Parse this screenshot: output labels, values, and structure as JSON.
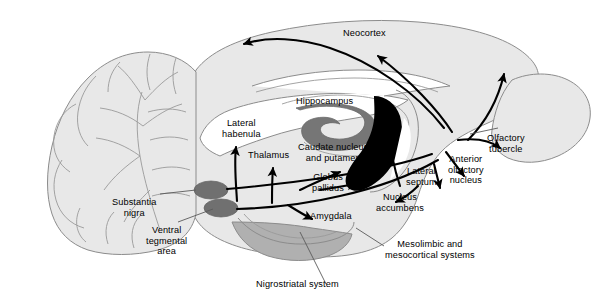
{
  "figure": {
    "type": "anatomical-diagram",
    "background_color": "#ffffff",
    "outline_color": "#808080",
    "brain_fill": "#e8e8e8",
    "nucleus_fill": "#707070",
    "caudate_fill": "#000000",
    "pathway_color": "#000000",
    "leader_color": "#555555"
  },
  "labels": {
    "neocortex": "Neocortex",
    "hippocampus": "Hippocampus",
    "lateral_habenula": "Lateral\nhabenula",
    "thalamus": "Thalamus",
    "caudate_putamen": "Caudate nucleus\nand putamen",
    "globus_pallidus": "Globus\npallidus",
    "amygdala": "Amygdala",
    "lateral_septum": "Lateral\nseptum",
    "nucleus_accumbens": "Nucleus\naccumbens",
    "anterior_olfactory_nucleus": "Anterior\nolfactory\nnucleus",
    "olfactory_tubercle": "Olfactory\ntubercle",
    "substantia_nigra": "Substantia\nnigra",
    "ventral_tegmental_area": "Ventral\ntegmental\narea",
    "nigrostriatal_system": "Nigrostriatal system",
    "mesolimbic_mesocortical": "Mesolimbic and\nmesocortical systems"
  },
  "structures": [
    {
      "name": "cerebellum",
      "fill": "#e8e8e8"
    },
    {
      "name": "cerebral-cortex",
      "fill": "#e8e8e8"
    },
    {
      "name": "olfactory-bulb",
      "fill": "#e8e8e8"
    },
    {
      "name": "hippocampus-body",
      "fill": "#767676"
    },
    {
      "name": "caudate-putamen-body",
      "fill": "#000000"
    },
    {
      "name": "substantia-nigra-body",
      "fill": "#707070"
    },
    {
      "name": "ventral-tegmental-area-body",
      "fill": "#707070"
    },
    {
      "name": "brainstem-pons",
      "fill": "#b0b0b0"
    },
    {
      "name": "lateral-ventricle",
      "fill": "#ffffff"
    }
  ],
  "pathways": [
    {
      "name": "nigrostriatal-system",
      "origin": "substantia nigra",
      "targets": [
        "Caudate nucleus and putamen",
        "Globus pallidus"
      ]
    },
    {
      "name": "mesolimbic-mesocortical-systems",
      "origin": "ventral tegmental area",
      "targets": [
        "Neocortex",
        "Hippocampus",
        "Amygdala",
        "Lateral septum",
        "Nucleus accumbens",
        "Anterior olfactory nucleus",
        "Olfactory tubercle",
        "Lateral habenula",
        "Thalamus"
      ]
    }
  ]
}
